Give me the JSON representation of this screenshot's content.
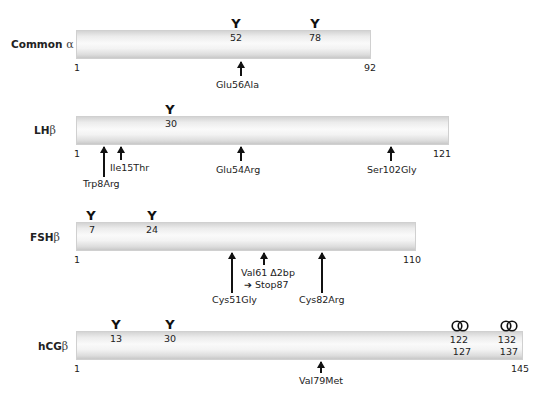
{
  "diagram": {
    "rows": [
      {
        "name": "Common",
        "greek": "α",
        "start": "1",
        "end": "92",
        "glycosylation_sites": [
          {
            "symbol": "Y",
            "position": "52"
          },
          {
            "symbol": "Y",
            "position": "78"
          }
        ],
        "mutations": [
          {
            "label": "Glu56Ala"
          }
        ]
      },
      {
        "name": "LH",
        "greek": "β",
        "start": "1",
        "end": "121",
        "glycosylation_sites": [
          {
            "symbol": "Y",
            "position": "30"
          }
        ],
        "mutations": [
          {
            "label": "Trp8Arg"
          },
          {
            "label": "Ile15Thr"
          },
          {
            "label": "Glu54Arg"
          },
          {
            "label": "Ser102Gly"
          }
        ]
      },
      {
        "name": "FSH",
        "greek": "β",
        "start": "1",
        "end": "110",
        "glycosylation_sites": [
          {
            "symbol": "Y",
            "position": "7"
          },
          {
            "symbol": "Y",
            "position": "24"
          }
        ],
        "mutations": [
          {
            "label": "Cys51Gly"
          },
          {
            "label": "Val61 Δ2bp",
            "sub": "➔ Stop87"
          },
          {
            "label": "Cys82Arg"
          }
        ]
      },
      {
        "name": "hCG",
        "greek": "β",
        "start": "1",
        "end": "145",
        "glycosylation_sites": [
          {
            "symbol": "Y",
            "position": "13"
          },
          {
            "symbol": "Y",
            "position": "30"
          }
        ],
        "o_glycosylation_sites": [
          {
            "top": "122",
            "bottom": "127"
          },
          {
            "top": "132",
            "bottom": "137"
          }
        ],
        "mutations": [
          {
            "label": "Val79Met"
          }
        ]
      }
    ]
  }
}
